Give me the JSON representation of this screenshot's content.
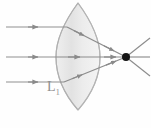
{
  "figure": {
    "kind": "optics-ray-diagram",
    "background_color": "#fefefe",
    "width": 151,
    "height": 128
  },
  "lens": {
    "label": "L",
    "label_subscript": "1",
    "type": "biconvex",
    "fill_color": "#e9e9e9",
    "stroke_color": "#b8b8b8",
    "center_x": 78,
    "top_y": 3,
    "bottom_y": 110,
    "half_width": 22
  },
  "optical_axis": {
    "y": 57,
    "color": "#9a9a9a"
  },
  "focal_point": {
    "label": "",
    "x": 126,
    "y": 57,
    "color": "#1a1a1a",
    "radius": 4
  },
  "incoming_rays": [
    {
      "name": "ray-top",
      "y": 27,
      "x_start": 6,
      "x_end": 60,
      "arrow_x": 36
    },
    {
      "name": "ray-middle",
      "y": 57,
      "x_start": 6,
      "x_end": 60,
      "arrow_x": 36
    },
    {
      "name": "ray-bottom",
      "y": 82,
      "x_start": 6,
      "x_end": 60,
      "arrow_x": 36
    }
  ],
  "refracted_rays": [
    {
      "name": "refracted-top",
      "from_y": 27,
      "arrow_x": 72,
      "arrow2_x": 110
    },
    {
      "name": "refracted-middle",
      "from_y": 57,
      "arrow_x": 72,
      "arrow2_x": 110
    },
    {
      "name": "refracted-bottom",
      "from_y": 82,
      "arrow_x": 72,
      "arrow2_x": 110
    }
  ],
  "diverging_rays": [
    {
      "name": "diverging-upper",
      "end_x": 150,
      "end_y": 38
    },
    {
      "name": "diverging-middle",
      "end_x": 150,
      "end_y": 57
    },
    {
      "name": "diverging-lower",
      "end_x": 150,
      "end_y": 76
    }
  ],
  "colors": {
    "ray": "#8f8f8f",
    "ray_dark": "#7d7d7d",
    "lens_fill": "#e7e7e7",
    "lens_stroke": "#bdbdbd",
    "focal_dot": "#141414",
    "label_text": "#8e8e8e"
  }
}
